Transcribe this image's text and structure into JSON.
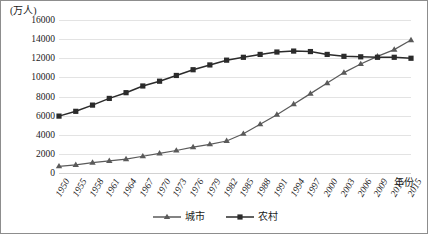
{
  "chart_data": {
    "type": "line",
    "title": "",
    "subtitle": "",
    "xlabel": "年份",
    "ylabel": "(万人)",
    "ylim": [
      0,
      16000
    ],
    "ytick_step": 2000,
    "yticks": [
      "0",
      "2000",
      "4000",
      "6000",
      "8000",
      "10000",
      "12000",
      "14000",
      "16000"
    ],
    "grid": true,
    "legend_position": "bottom",
    "categories": [
      "1950",
      "1955",
      "1958",
      "1961",
      "1964",
      "1967",
      "1970",
      "1973",
      "1976",
      "1979",
      "1982",
      "1985",
      "1988",
      "1991",
      "1994",
      "1997",
      "2000",
      "2003",
      "2006",
      "2009",
      "2012",
      "2015"
    ],
    "series": [
      {
        "name": "城市",
        "marker": "triangle",
        "color": "#5a5a5a",
        "values": [
          700,
          850,
          1080,
          1270,
          1450,
          1750,
          2050,
          2350,
          2700,
          3000,
          3350,
          4100,
          5100,
          6100,
          7200,
          8300,
          9400,
          10500,
          11400,
          12200,
          12900,
          13900
        ]
      },
      {
        "name": "农村",
        "marker": "square",
        "color": "#2b2b2b",
        "values": [
          5950,
          6450,
          7100,
          7800,
          8400,
          9100,
          9600,
          10200,
          10800,
          11300,
          11800,
          12100,
          12400,
          12650,
          12750,
          12700,
          12400,
          12200,
          12150,
          12100,
          12100,
          12000
        ]
      }
    ]
  },
  "legend": {
    "items": [
      {
        "label": "城市"
      },
      {
        "label": "农村"
      }
    ]
  }
}
